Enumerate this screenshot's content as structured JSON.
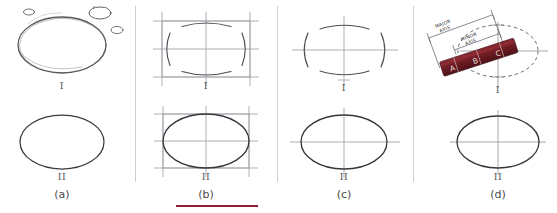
{
  "figure": {
    "background": "#ffffff",
    "width": 557,
    "height": 213,
    "ink_color": "#55555a",
    "dark_ink_color": "#2f2f33",
    "construction_color": "#8f8f96",
    "trammel_color": "#6d1b22",
    "rule_color": "#8c2231"
  },
  "panels": [
    {
      "key": "a",
      "label": "(a)",
      "method": "freehand-sketch",
      "stage_one_label": "I",
      "stage_two_label": "II",
      "description": "Freehand sketched ellipse with small trial ovals"
    },
    {
      "key": "b",
      "label": "(b)",
      "method": "construction-box-arcs",
      "stage_one_label": "I",
      "stage_two_label": "II",
      "description": "Rectangle construction box with four tangent arcs"
    },
    {
      "key": "c",
      "label": "(c)",
      "method": "centerline-arcs",
      "stage_one_label": "I",
      "stage_two_label": "II",
      "description": "Centerlines with four tangent arcs, no box"
    },
    {
      "key": "d",
      "label": "(d)",
      "method": "trammel",
      "stage_one_label": "I",
      "stage_two_label": "II",
      "description": "Trammel (paper strip) method with dashed ellipse"
    }
  ],
  "trammel": {
    "major_axis_label": "MAJOR AXIS",
    "minor_axis_label": "MINOR AXIS",
    "marks": [
      "A",
      "B",
      "C"
    ]
  },
  "dividers": [
    135,
    277,
    413
  ],
  "bottom_rule": {
    "x_start": 176,
    "x_end": 258,
    "y": 206
  }
}
